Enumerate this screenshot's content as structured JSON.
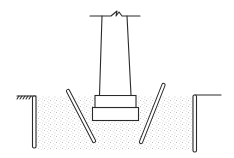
{
  "diagram": {
    "type": "column footing excavation section",
    "colors": {
      "line": "#2a2a2a",
      "soil_dots": "#8a8a8a",
      "background": "#ffffff"
    },
    "elements": [
      {
        "name": "column",
        "description": "tapered column with break line at top"
      },
      {
        "name": "footing-upper-step",
        "description": "upper footing step"
      },
      {
        "name": "footing-lower-step",
        "description": "lower footing step"
      },
      {
        "name": "backfill-soil",
        "description": "stippled fill around footing"
      },
      {
        "name": "left-sheet-pile",
        "description": "vertical retaining wall left"
      },
      {
        "name": "right-sheet-pile",
        "description": "vertical retaining wall right"
      },
      {
        "name": "left-inclined-strut",
        "description": "inclined member left of footing"
      },
      {
        "name": "right-inclined-strut",
        "description": "inclined double-line member right of footing"
      },
      {
        "name": "ground-surface-left",
        "description": "ground line with hatch marks"
      },
      {
        "name": "ground-surface-right",
        "description": "ground line right"
      }
    ]
  }
}
